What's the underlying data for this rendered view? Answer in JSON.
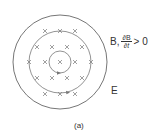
{
  "figure": {
    "label_B": "B,",
    "fraction_numerator": "∂B",
    "fraction_denominator": "∂t",
    "inequality": "> 0",
    "label_E": "E",
    "caption": "(a)"
  },
  "geometry": {
    "center": [
      60,
      62
    ],
    "outer_radius": 47,
    "middle_radius": 31,
    "inner_radius": 11,
    "line_color": "#666666",
    "cross_color": "#777777",
    "crosses": [
      [
        45,
        31
      ],
      [
        60,
        31
      ],
      [
        75,
        31
      ],
      [
        37,
        47
      ],
      [
        52,
        47
      ],
      [
        67,
        47
      ],
      [
        82,
        47
      ],
      [
        29,
        62
      ],
      [
        45,
        62
      ],
      [
        60,
        62
      ],
      [
        75,
        62
      ],
      [
        91,
        62
      ],
      [
        37,
        78
      ],
      [
        52,
        78
      ],
      [
        67,
        78
      ],
      [
        82,
        78
      ],
      [
        45,
        94
      ],
      [
        60,
        94
      ],
      [
        75,
        94
      ]
    ]
  }
}
